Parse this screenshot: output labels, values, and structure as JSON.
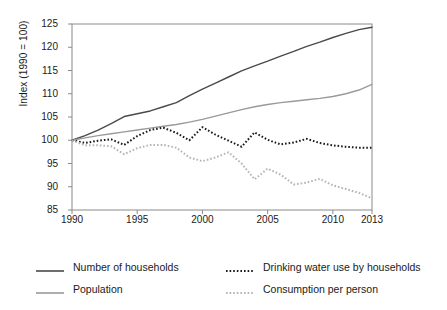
{
  "chart_data": {
    "type": "line",
    "title": "",
    "subtitle": "",
    "xlabel": "",
    "ylabel": "Index (1990 = 100)",
    "xlim": [
      1990,
      2013
    ],
    "ylim": [
      85,
      125
    ],
    "grid": false,
    "legend_position": "bottom",
    "x_ticks": [
      "1990",
      "1995",
      "2000",
      "2005",
      "2010",
      "2013"
    ],
    "x_tick_values": [
      1990,
      1995,
      2000,
      2005,
      2010,
      2013
    ],
    "y_ticks": [
      "85",
      "90",
      "95",
      "100",
      "105",
      "110",
      "115",
      "120",
      "125"
    ],
    "y_tick_values": [
      85,
      90,
      95,
      100,
      105,
      110,
      115,
      120,
      125
    ],
    "x": [
      1990,
      1991,
      1992,
      1993,
      1994,
      1995,
      1996,
      1997,
      1998,
      1999,
      2000,
      2001,
      2002,
      2003,
      2004,
      2005,
      2006,
      2007,
      2008,
      2009,
      2010,
      2011,
      2012,
      2013
    ],
    "series": [
      {
        "name": "Number of households",
        "color": "#4a4a4a",
        "style": "solid",
        "values": [
          100.0,
          101.0,
          102.2,
          103.6,
          105.1,
          105.7,
          106.3,
          107.2,
          108.1,
          109.6,
          111.0,
          112.3,
          113.6,
          114.9,
          116.0,
          117.0,
          118.1,
          119.1,
          120.2,
          121.1,
          122.1,
          123.0,
          123.8,
          124.3
        ]
      },
      {
        "name": "Population",
        "color": "#9a9a9a",
        "style": "solid",
        "values": [
          100.0,
          100.5,
          101.0,
          101.4,
          101.8,
          102.2,
          102.6,
          103.0,
          103.4,
          103.9,
          104.5,
          105.2,
          105.9,
          106.6,
          107.2,
          107.7,
          108.1,
          108.4,
          108.7,
          109.0,
          109.4,
          110.0,
          110.8,
          112.0
        ]
      },
      {
        "name": "Drinking water use by households",
        "color": "#1a1a1a",
        "style": "dotted",
        "values": [
          100.0,
          99.4,
          99.9,
          100.2,
          99.0,
          100.9,
          102.2,
          102.7,
          101.6,
          100.0,
          102.8,
          101.2,
          99.9,
          98.6,
          101.7,
          100.1,
          99.1,
          99.5,
          100.3,
          99.4,
          98.9,
          98.6,
          98.4,
          98.4
        ]
      },
      {
        "name": "Consumption per person",
        "color": "#b5b5b5",
        "style": "dotted",
        "values": [
          100.0,
          98.9,
          98.9,
          98.7,
          97.0,
          98.3,
          99.0,
          99.0,
          98.4,
          96.3,
          95.5,
          96.3,
          97.4,
          95.0,
          91.6,
          93.9,
          92.6,
          90.5,
          90.9,
          91.7,
          90.3,
          89.5,
          88.7,
          87.5
        ]
      }
    ],
    "annotations": []
  },
  "legend": {
    "entries": [
      {
        "label": "Number of households"
      },
      {
        "label": "Drinking water use by households"
      },
      {
        "label": "Population"
      },
      {
        "label": "Consumption per person"
      }
    ]
  }
}
